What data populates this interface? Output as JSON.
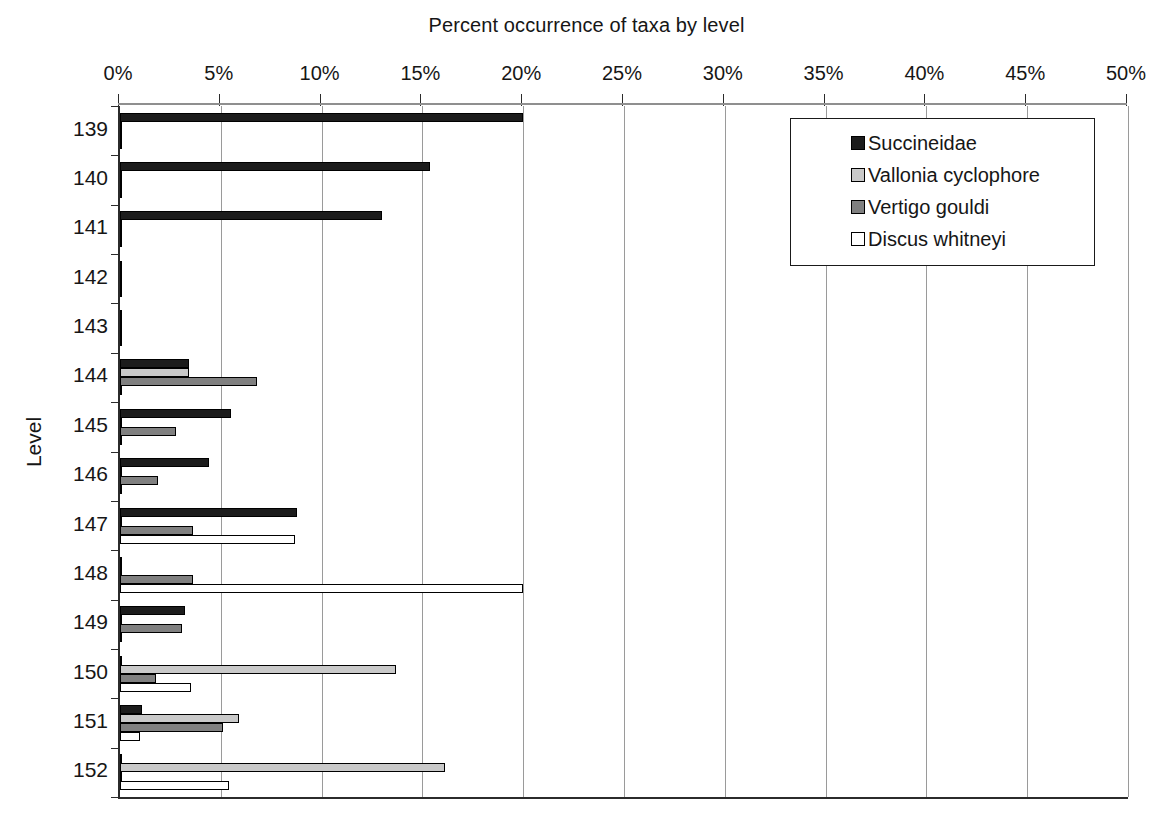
{
  "chart_data": {
    "type": "bar",
    "orientation": "horizontal",
    "title": "Percent occurrence of taxa by level",
    "xlabel": "",
    "ylabel": "Level",
    "xlim": [
      0,
      50
    ],
    "xunit": "%",
    "xticks": [
      "0%",
      "5%",
      "10%",
      "15%",
      "20%",
      "25%",
      "30%",
      "35%",
      "40%",
      "45%",
      "50%"
    ],
    "xtick_values": [
      0,
      5,
      10,
      15,
      20,
      25,
      30,
      35,
      40,
      45,
      50
    ],
    "grid": "vertical",
    "legend_position": "top-right",
    "categories": [
      "139",
      "140",
      "141",
      "142",
      "143",
      "144",
      "145",
      "146",
      "147",
      "148",
      "149",
      "150",
      "151",
      "152"
    ],
    "series": [
      {
        "name": "Succineidae",
        "color": "#1c1c1c",
        "values": [
          20.0,
          15.4,
          13.0,
          0,
          0,
          3.4,
          5.5,
          4.4,
          8.8,
          0,
          3.2,
          0,
          1.1,
          0
        ]
      },
      {
        "name": "Vallonia cyclophore",
        "color": "#c9c9c9",
        "values": [
          0,
          0,
          0,
          0,
          0,
          3.4,
          0,
          0,
          0,
          0,
          0,
          13.7,
          5.9,
          16.1
        ]
      },
      {
        "name": "Vertigo gouldi",
        "color": "#808080",
        "values": [
          0,
          0,
          0,
          0,
          0,
          6.8,
          2.8,
          1.9,
          3.6,
          3.6,
          3.1,
          1.8,
          5.1,
          0
        ]
      },
      {
        "name": "Discus whitneyi",
        "color": "#ffffff",
        "values": [
          0,
          0,
          0,
          0,
          0,
          0,
          0,
          0,
          8.7,
          20.0,
          0,
          3.5,
          1.0,
          5.4
        ]
      }
    ]
  },
  "legend": {
    "items": [
      {
        "label": "Succineidae",
        "color": "#1c1c1c"
      },
      {
        "label": "Vallonia cyclophore",
        "color": "#c9c9c9"
      },
      {
        "label": "Vertigo gouldi",
        "color": "#808080"
      },
      {
        "label": "Discus whitneyi",
        "color": "#ffffff"
      }
    ]
  }
}
